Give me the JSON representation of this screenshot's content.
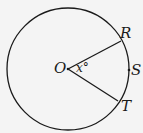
{
  "diagram": {
    "type": "circle-with-central-angle",
    "center": {
      "label": "O",
      "x": 68,
      "y": 69
    },
    "radius": 61,
    "points": [
      {
        "label": "R",
        "x": 121,
        "y": 41
      },
      {
        "label": "S",
        "x": 129,
        "y": 70
      },
      {
        "label": "T",
        "x": 118,
        "y": 101
      }
    ],
    "angle_label": "x°",
    "segments": [
      "OR",
      "OT"
    ],
    "colors": {
      "stroke": "#1a1a1a",
      "background": "#f4f4f4"
    }
  }
}
